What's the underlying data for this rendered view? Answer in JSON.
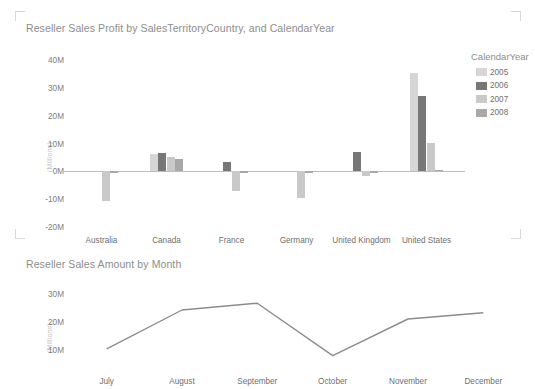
{
  "page": {
    "background": "#ffffff",
    "text_color": "#8a8a8a"
  },
  "bar_visual": {
    "title": "Reseller Sales Profit by SalesTerritoryCountry, and CalendarYear",
    "legend": {
      "title": "CalendarYear",
      "items": [
        {
          "label": "2005",
          "color": "#d6d6d6"
        },
        {
          "label": "2006",
          "color": "#777777"
        },
        {
          "label": "2007",
          "color": "#c9c9c9"
        },
        {
          "label": "2008",
          "color": "#a8a8a8"
        }
      ]
    }
  },
  "line_visual": {
    "title": "Reseller Sales Amount by Month"
  },
  "chart_data": [
    {
      "type": "bar",
      "title": "Reseller Sales Profit by SalesTerritoryCountry, and CalendarYear",
      "xlabel": "",
      "ylabel": "(Millions)",
      "ylim": [
        -20000000,
        40000000
      ],
      "yticks": [
        40000000,
        30000000,
        20000000,
        10000000,
        0,
        -10000000,
        -20000000
      ],
      "ytick_labels": [
        "40M",
        "30M",
        "20M",
        "10M",
        "0M",
        "-10M",
        "-20M"
      ],
      "categories": [
        "Australia",
        "Canada",
        "France",
        "Germany",
        "United Kingdom",
        "United States"
      ],
      "legend_title": "CalendarYear",
      "legend_position": "right",
      "grid": false,
      "series": [
        {
          "name": "2005",
          "color": "#d6d6d6",
          "values": [
            0,
            6200000,
            0,
            0,
            0,
            35500000
          ]
        },
        {
          "name": "2006",
          "color": "#777777",
          "values": [
            0,
            6600000,
            3500000,
            0,
            7000000,
            27000000
          ]
        },
        {
          "name": "2007",
          "color": "#c9c9c9",
          "values": [
            -10500000,
            5100000,
            -7200000,
            -9600000,
            -1800000,
            10200000
          ]
        },
        {
          "name": "2008",
          "color": "#a8a8a8",
          "values": [
            -600000,
            4300000,
            -300000,
            -400000,
            -600000,
            600000
          ]
        }
      ]
    },
    {
      "type": "line",
      "title": "Reseller Sales Amount by Month",
      "xlabel": "",
      "ylabel": "(Millions)",
      "ylim": [
        5000000,
        32000000
      ],
      "yticks": [
        30000000,
        20000000,
        10000000
      ],
      "ytick_labels": [
        "30M",
        "20M",
        "10M"
      ],
      "categories": [
        "July",
        "August",
        "September",
        "October",
        "November",
        "December"
      ],
      "grid": false,
      "line_color": "#8c8c8c",
      "series": [
        {
          "name": "Reseller Sales Amount",
          "values": [
            10400000,
            24200000,
            26600000,
            8000000,
            21000000,
            23200000
          ]
        }
      ]
    }
  ]
}
